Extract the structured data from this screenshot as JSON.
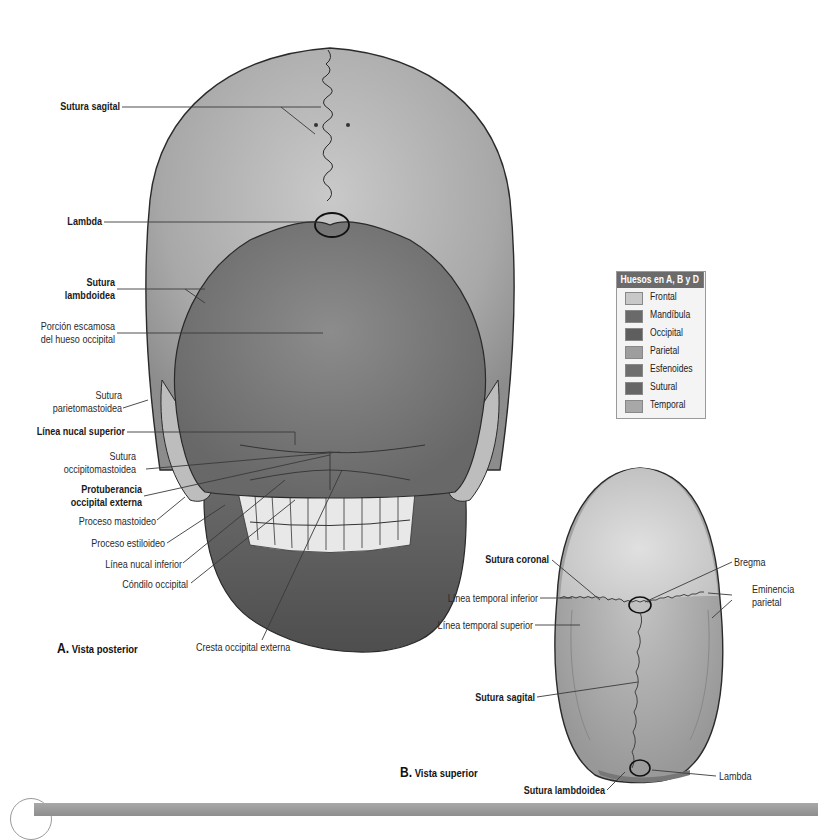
{
  "figure_a": {
    "caption_letter": "A.",
    "caption_text": "Vista posterior",
    "labels": {
      "sutura_sagital": "Sutura sagital",
      "lambda": "Lambda",
      "sutura_lambdoidea_1": "Sutura",
      "sutura_lambdoidea_2": "lambdoidea",
      "porcion_escamosa_1": "Porción escamosa",
      "porcion_escamosa_2": "del hueso occipital",
      "sutura_parietomastoidea_1": "Sutura",
      "sutura_parietomastoidea_2": "parietomastoidea",
      "linea_nucal_superior": "Línea nucal superior",
      "sutura_occipitomastoidea_1": "Sutura",
      "sutura_occipitomastoidea_2": "occipitomastoidea",
      "protuberancia_1": "Protuberancia",
      "protuberancia_2": "occipital externa",
      "proceso_mastoideo": "Proceso mastoideo",
      "proceso_estiloideo": "Proceso estiloideo",
      "linea_nucal_inferior": "Línea nucal inferior",
      "condilo_occipital": "Cóndilo occipital",
      "cresta_occipital_externa": "Cresta occipital externa"
    }
  },
  "figure_b": {
    "caption_letter": "B.",
    "caption_text": "Vista superior",
    "labels": {
      "sutura_coronal": "Sutura coronal",
      "bregma": "Bregma",
      "eminencia_parietal_1": "Eminencia",
      "eminencia_parietal_2": "parietal",
      "linea_temporal_inferior": "Línea temporal inferior",
      "linea_temporal_superior": "Línea temporal superior",
      "sutura_sagital": "Sutura sagital",
      "lambda": "Lambda",
      "sutura_lambdoidea": "Sutura lambdoidea"
    }
  },
  "legend": {
    "title": "Huesos en A, B y D",
    "items": [
      {
        "label": "Frontal",
        "color": "#c8c8c8"
      },
      {
        "label": "Mandíbula",
        "color": "#6a6a6a"
      },
      {
        "label": "Occipital",
        "color": "#5e5e5e"
      },
      {
        "label": "Parietal",
        "color": "#9e9e9e"
      },
      {
        "label": "Esfenoides",
        "color": "#6e6e6e"
      },
      {
        "label": "Sutural",
        "color": "#666666"
      },
      {
        "label": "Temporal",
        "color": "#a8a8a8"
      }
    ]
  },
  "colors": {
    "parietal": "#a9a9a9",
    "occipital": "#7a7a7a",
    "mandible": "#5a5a5a",
    "temporal": "#bdbdbd",
    "frontal": "#cfcfcf",
    "outline": "#2a2a2a",
    "leader": "#3a3a3a"
  }
}
